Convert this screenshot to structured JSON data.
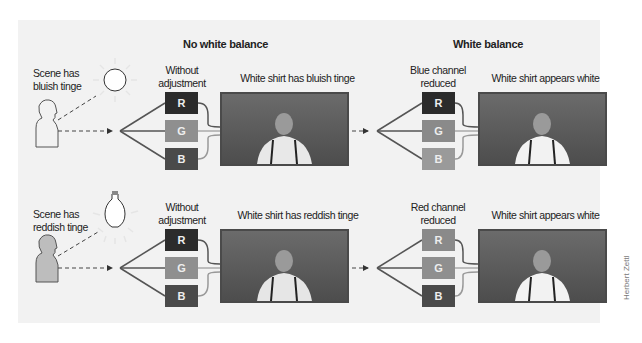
{
  "sections": {
    "left_title": "No white balance",
    "right_title": "White balance"
  },
  "rows": [
    {
      "scene_label_1": "Scene has",
      "scene_label_2": "bluish tinge",
      "light_icon": "sun-icon",
      "left_channel_label_1": "Without",
      "left_channel_label_2": "adjustment",
      "left_photo_caption": "White shirt has bluish tinge",
      "right_channel_label_1": "Blue channel",
      "right_channel_label_2": "reduced",
      "right_photo_caption": "White shirt appears white",
      "left_channels": [
        {
          "label": "R",
          "color": "#2b2b2b"
        },
        {
          "label": "G",
          "color": "#8f8f8f"
        },
        {
          "label": "B",
          "color": "#4a4a4a"
        }
      ],
      "right_channels": [
        {
          "label": "R",
          "color": "#2b2b2b"
        },
        {
          "label": "G",
          "color": "#8a8a8a"
        },
        {
          "label": "B",
          "color": "#9a9a9a"
        }
      ]
    },
    {
      "scene_label_1": "Scene has",
      "scene_label_2": "reddish tinge",
      "light_icon": "light-bulb-icon",
      "left_channel_label_1": "Without",
      "left_channel_label_2": "adjustment",
      "left_photo_caption": "White shirt has reddish tinge",
      "right_channel_label_1": "Red channel",
      "right_channel_label_2": "reduced",
      "right_photo_caption": "White shirt appears white",
      "left_channels": [
        {
          "label": "R",
          "color": "#2b2b2b"
        },
        {
          "label": "G",
          "color": "#8f8f8f"
        },
        {
          "label": "B",
          "color": "#4a4a4a"
        }
      ],
      "right_channels": [
        {
          "label": "R",
          "color": "#8a8a8a"
        },
        {
          "label": "G",
          "color": "#8f8f8f"
        },
        {
          "label": "B",
          "color": "#4a4a4a"
        }
      ]
    }
  ],
  "credit": "Herbert Zettl"
}
